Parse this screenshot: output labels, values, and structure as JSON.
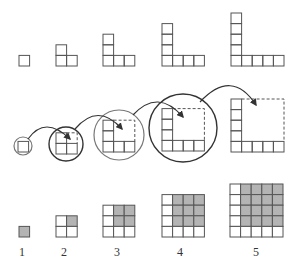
{
  "figure": {
    "cell_size": 10.6,
    "colors": {
      "stroke": "#555555",
      "circle_dark": "#333333",
      "circle_light": "#777777",
      "fill_gray": "#b4b4b4",
      "background": "#ffffff"
    },
    "labels": [
      "1",
      "2",
      "3",
      "4",
      "5"
    ],
    "top_row": {
      "title": "Gnomons (L-shapes) of 1, 3, 5, 7, 9 cells",
      "shapes": [
        {
          "n": 1,
          "x": 19,
          "base_y": 66,
          "cells": 1
        },
        {
          "n": 2,
          "x": 56,
          "base_y": 66,
          "cells": 3
        },
        {
          "n": 3,
          "x": 103,
          "base_y": 66,
          "cells": 5
        },
        {
          "n": 4,
          "x": 162,
          "base_y": 66,
          "cells": 7
        },
        {
          "n": 5,
          "x": 231,
          "base_y": 66,
          "cells": 9
        }
      ]
    },
    "middle_row": {
      "title": "Each square nested into the next gnomon",
      "shapes": [
        {
          "n": 1,
          "x": 18,
          "base_y": 152,
          "circle": {
            "cx": 23,
            "cy": 146,
            "r": 9,
            "tone": "light"
          }
        },
        {
          "n": 2,
          "x": 56,
          "base_y": 154,
          "circle": {
            "cx": 66,
            "cy": 144,
            "r": 17,
            "tone": "dark"
          }
        },
        {
          "n": 3,
          "x": 103,
          "base_y": 152,
          "circle": {
            "cx": 119,
            "cy": 135,
            "r": 25,
            "tone": "light"
          }
        },
        {
          "n": 4,
          "x": 162,
          "base_y": 151,
          "circle": {
            "cx": 183,
            "cy": 128,
            "r": 34,
            "tone": "dark"
          }
        },
        {
          "n": 5,
          "x": 231,
          "base_y": 152,
          "circle": null
        }
      ],
      "arrows": [
        {
          "from": [
            28,
            139
          ],
          "ctrl": [
            45,
            115
          ],
          "to": [
            70,
            139
          ]
        },
        {
          "from": [
            75,
            129
          ],
          "ctrl": [
            98,
            102
          ],
          "to": [
            122,
            129
          ]
        },
        {
          "from": [
            133,
            115
          ],
          "ctrl": [
            158,
            88
          ],
          "to": [
            183,
            117
          ]
        },
        {
          "from": [
            200,
            102
          ],
          "ctrl": [
            232,
            68
          ],
          "to": [
            256,
            105
          ]
        }
      ]
    },
    "bottom_row": {
      "title": "Squares 1, 4, 9, 16, 25 with previous square shaded",
      "shapes": [
        {
          "n": 1,
          "x": 19,
          "base_y": 237,
          "label": "1",
          "label_x": 22
        },
        {
          "n": 2,
          "x": 56,
          "base_y": 237,
          "label": "2",
          "label_x": 64
        },
        {
          "n": 3,
          "x": 103,
          "base_y": 237,
          "label": "3",
          "label_x": 117
        },
        {
          "n": 4,
          "x": 162,
          "base_y": 237,
          "label": "4",
          "label_x": 180
        },
        {
          "n": 5,
          "x": 230,
          "base_y": 237,
          "label": "5",
          "label_x": 256
        }
      ],
      "label_y": 256
    }
  }
}
